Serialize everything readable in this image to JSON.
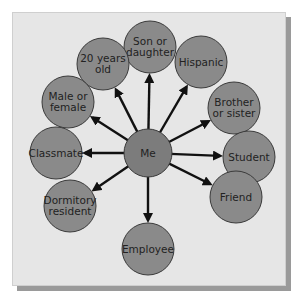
{
  "diagram": {
    "type": "hub-and-spoke",
    "center": {
      "label": "Me",
      "x": 148,
      "y": 153,
      "r": 24
    },
    "nodes": [
      {
        "id": "son-or-daughter",
        "lines": [
          "Son or",
          "daughter"
        ],
        "x": 150,
        "y": 47
      },
      {
        "id": "twenty-years-old",
        "lines": [
          "20 years",
          "old"
        ],
        "x": 103,
        "y": 64
      },
      {
        "id": "hispanic",
        "lines": [
          "Hispanic"
        ],
        "x": 201,
        "y": 62
      },
      {
        "id": "male-or-female",
        "lines": [
          "Male or",
          "female"
        ],
        "x": 68,
        "y": 102
      },
      {
        "id": "brother-or-sister",
        "lines": [
          "Brother",
          "or sister"
        ],
        "x": 234,
        "y": 108
      },
      {
        "id": "classmate",
        "lines": [
          "Classmate"
        ],
        "x": 56,
        "y": 153
      },
      {
        "id": "student",
        "lines": [
          "Student"
        ],
        "x": 249,
        "y": 157
      },
      {
        "id": "dormitory-resident",
        "lines": [
          "Dormitory",
          "resident"
        ],
        "x": 70,
        "y": 206
      },
      {
        "id": "friend",
        "lines": [
          "Friend"
        ],
        "x": 236,
        "y": 197
      },
      {
        "id": "employee",
        "lines": [
          "Employee"
        ],
        "x": 148,
        "y": 249
      }
    ],
    "colors": {
      "node_fill": "#8a8a8a",
      "node_stroke": "#3a3a3a",
      "arrow": "#111111",
      "card": "#e6e6e6",
      "shadow": "#9a9a9a"
    }
  }
}
